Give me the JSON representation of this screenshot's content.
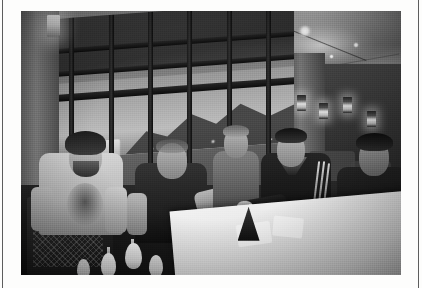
{
  "page": {
    "background_color": "#fdfdfc",
    "rule_color": "#5d5d5d",
    "caption": ""
  },
  "photo": {
    "name": "lobby-group-photo",
    "treatment": "black-and-white",
    "frame_color": "#ffffff",
    "description": "Five men seated around a white-clothed table in a hotel lobby lounge at dusk",
    "regions": {
      "ceiling": "vaulted-ceiling-with-recessed-downlights",
      "window_wall": "tall-mullioned-window-wall",
      "outside_view": "mountain-silhouette-and-city-lights-at-dusk",
      "right_interior": "columns-shelving-and-hanging-lanterns",
      "foreground": "white-table-with-dark-conical-napkin-holder"
    },
    "subjects": [
      {
        "id": "man-1",
        "position": "far-left",
        "hair": "curly-dark",
        "facial_hair": "beard",
        "clothing": "light-grey-graphic-t-shirt",
        "pose": "seated-leaning-forward"
      },
      {
        "id": "man-2",
        "position": "left-center",
        "hair": "shaved-head",
        "facial_hair": "none",
        "clothing": "dark-t-shirt",
        "pose": "seated-gesturing"
      },
      {
        "id": "man-3",
        "position": "center-back",
        "hair": "short-light",
        "facial_hair": "none",
        "clothing": "mid-grey-shirt",
        "pose": "standing-behind-table"
      },
      {
        "id": "man-4",
        "position": "right-center",
        "hair": "short-dark",
        "facial_hair": "none",
        "clothing": "dark-track-jacket-with-white-sleeve-stripes",
        "pose": "seated-leaning-on-table"
      },
      {
        "id": "man-5",
        "position": "far-right",
        "hair": "short-dark",
        "facial_hair": "none",
        "clothing": "dark-top",
        "pose": "seated-leaning-forward"
      }
    ],
    "objects": [
      {
        "id": "table",
        "label": "white-linen-table"
      },
      {
        "id": "napkin-cone",
        "label": "dark-conical-napkin-holder"
      },
      {
        "id": "napkins",
        "label": "folded-white-napkins"
      },
      {
        "id": "glasses",
        "label": "tulip-shaped-white-glasses"
      },
      {
        "id": "armchair",
        "label": "woven-back-armchair"
      },
      {
        "id": "wall-sconce",
        "label": "lit-wall-sconce"
      },
      {
        "id": "lanterns",
        "label": "hanging-lantern-lights"
      }
    ],
    "lighting": {
      "downlight_count": 7,
      "lantern_count": 4,
      "sconce_count": 1
    }
  }
}
